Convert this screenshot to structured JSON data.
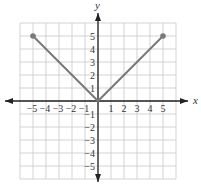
{
  "chart_data": {
    "type": "line",
    "title": "",
    "xlabel": "x",
    "ylabel": "y",
    "xlim": [
      -6,
      6
    ],
    "ylim": [
      -6,
      6
    ],
    "grid": true,
    "x_ticks": [
      -5,
      -4,
      -3,
      -2,
      -1,
      1,
      2,
      3,
      4,
      5
    ],
    "y_ticks": [
      -5,
      -4,
      -3,
      -2,
      -1,
      1,
      2,
      3,
      4,
      5
    ],
    "x_tick_labels": [
      "−5",
      "−4",
      "−3",
      "−2",
      "−1",
      "1",
      "2",
      "3",
      "4",
      "5"
    ],
    "y_tick_labels": [
      "−5",
      "−4",
      "−3",
      "−2",
      "−1",
      "1",
      "2",
      "3",
      "4",
      "5"
    ],
    "series": [
      {
        "name": "y = |x|",
        "x": [
          -5,
          0,
          5
        ],
        "y": [
          5,
          0,
          5
        ],
        "endpoints": "closed",
        "color": "#7a7a7a"
      }
    ]
  },
  "style": {
    "grid_color": "#c8c8c8",
    "axis_color": "#222222",
    "line_color": "#7a7a7a"
  }
}
